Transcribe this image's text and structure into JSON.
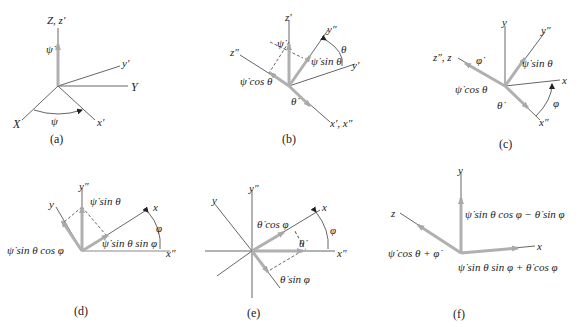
{
  "panels": [
    {
      "id": "a",
      "caption": "(a)",
      "labels": {
        "zaxis": "Z, z′",
        "y1": "y′",
        "Y": "Y",
        "X": "X",
        "x1": "x′",
        "psi": "ψ",
        "psidot": "ψ̇"
      }
    },
    {
      "id": "b",
      "caption": "(b)",
      "labels": {
        "z1": "z′",
        "z2": "z″",
        "y2": "y″",
        "y1": "y′",
        "theta": "θ",
        "psidot": "ψ̇",
        "psisin": "ψ̇ sin θ",
        "psicos": "ψ̇ cos θ",
        "thetadot": "θ̇",
        "x12": "x′, x″"
      }
    },
    {
      "id": "c",
      "caption": "(c)",
      "labels": {
        "y": "y",
        "y2": "y″",
        "z2z": "z″, z",
        "phidot": "φ̇",
        "psisin": "ψ̇ sin θ",
        "psicos": "ψ̇ cos θ",
        "x": "x",
        "thetadot": "θ̇",
        "phi": "φ",
        "x2": "x″"
      }
    },
    {
      "id": "d",
      "caption": "(d)",
      "labels": {
        "y2": "y″",
        "y": "y",
        "psisin": "ψ̇ sin θ",
        "x": "x",
        "phi": "φ",
        "cosphi": "ψ̇ sin θ cos φ",
        "sinphi": "ψ̇ sin θ sin φ",
        "x2": "x″"
      }
    },
    {
      "id": "e",
      "caption": "(e)",
      "labels": {
        "y2": "y″",
        "y": "y",
        "x": "x",
        "thcos": "θ̇ cos φ",
        "phi": "φ",
        "thetadot": "θ̇",
        "x2": "x″",
        "thsin": "θ̇ sin φ"
      }
    },
    {
      "id": "f",
      "caption": "(f)",
      "labels": {
        "y": "y",
        "z": "z",
        "x": "x",
        "wy": "ψ̇ sin θ cos φ − θ̇ sin φ",
        "wz": "ψ̇ cos θ + φ̇",
        "wx": "ψ̇ sin θ sin φ + θ̇ cos φ"
      }
    }
  ],
  "colors": {
    "axis": "#333333",
    "vector": "#b0b0b0",
    "dashed": "#555555"
  }
}
